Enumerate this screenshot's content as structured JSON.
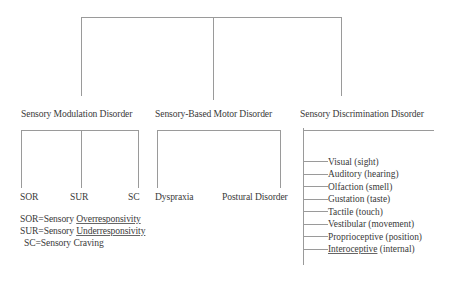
{
  "diagram": {
    "categories": [
      {
        "label": "Sensory Modulation Disorder",
        "subtypes": [
          "SOR",
          "SUR",
          "SC"
        ]
      },
      {
        "label": "Sensory-Based Motor Disorder",
        "subtypes": [
          "Dyspraxia",
          "Postural Disorder"
        ]
      },
      {
        "label": "Sensory Discrimination Disorder",
        "subtypes": [
          "Visual (sight)",
          "Auditory (hearing)",
          "Olfaction (smell)",
          "Gustation (taste)",
          "Tactile (touch)",
          "Vestibular (movement)",
          "Proprioceptive (position)",
          "Interoceptive (internal)"
        ]
      }
    ],
    "legend": [
      {
        "abbr": "SOR=Sensory",
        "term": "Overresponsivity"
      },
      {
        "abbr": "SUR=Sensory",
        "term": "Underresponsivity"
      },
      {
        "abbr": "SC=Sensory",
        "term": "Craving"
      }
    ],
    "line_color": "#9a9a9a",
    "text_color": "#3a3a3a"
  }
}
